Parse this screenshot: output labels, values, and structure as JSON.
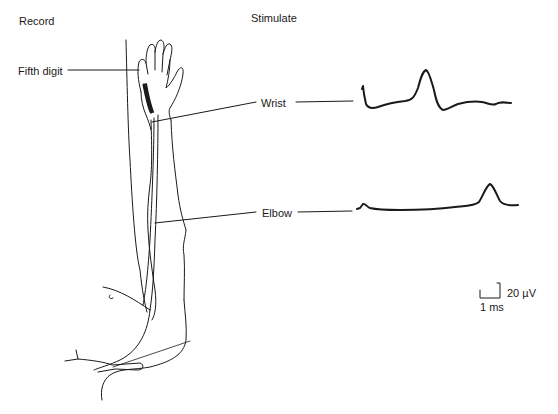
{
  "headers": {
    "record": "Record",
    "stimulate": "Stimulate"
  },
  "labels": {
    "fifth_digit": "Fifth digit",
    "wrist": "Wrist",
    "elbow": "Elbow"
  },
  "scale_bar": {
    "amplitude": "20 µV",
    "time": "1 ms"
  },
  "colors": {
    "ink": "#1a1a1a",
    "background": "#ffffff"
  },
  "traces": [
    {
      "site": "Wrist",
      "description": "Stimulus artifact followed by large sensory nerve action potential peak at short latency"
    },
    {
      "site": "Elbow",
      "description": "Small stimulus artifact followed by sensory nerve action potential peak at longer latency"
    }
  ]
}
